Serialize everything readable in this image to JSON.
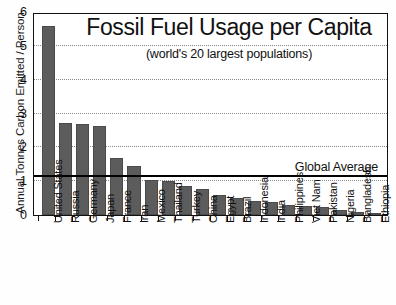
{
  "chart_data": {
    "type": "bar",
    "title": "Fossil Fuel Usage per Capita",
    "subtitle": "(world's 20 largest populations)",
    "xlabel": "",
    "ylabel": "Annual Tonnes Carbon Emitted / Person",
    "ylim": [
      0,
      6
    ],
    "yticks": [
      0,
      1,
      2,
      3,
      4,
      5,
      6
    ],
    "ytick_labels": [
      "0",
      "1",
      "2",
      "3",
      "4",
      "5",
      "6"
    ],
    "grid": true,
    "grid_axis": "y",
    "legend": false,
    "bar_color": "#5c5c5c",
    "categories": [
      "United States",
      "Russia",
      "Germany",
      "Japan",
      "France",
      "Iran",
      "Mexico",
      "Thailand",
      "Turkey",
      "China",
      "Egypt",
      "Brazil",
      "Indonesia",
      "India",
      "Philippines",
      "Viet Nam",
      "Pakistan",
      "Nigeria",
      "Bangladesh",
      "Ethiopia"
    ],
    "values": [
      5.58,
      2.72,
      2.7,
      2.62,
      1.69,
      1.45,
      1.04,
      1.02,
      0.86,
      0.77,
      0.58,
      0.51,
      0.41,
      0.37,
      0.3,
      0.27,
      0.25,
      0.15,
      0.08,
      0.03
    ],
    "annotations": [
      {
        "name": "global-average",
        "label": "Global Average",
        "value": 1.13,
        "type": "hline",
        "color": "#000000"
      }
    ]
  }
}
